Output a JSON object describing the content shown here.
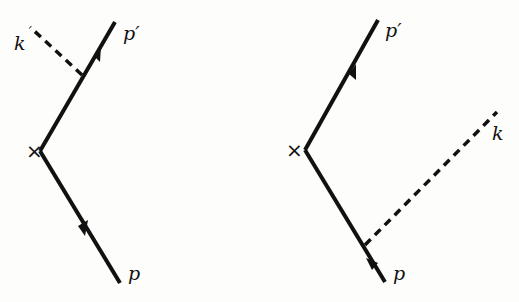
{
  "diagrams": [
    {
      "id": "left",
      "labels": {
        "incoming": "p",
        "outgoing": "p′",
        "photon": "k",
        "vertex": "×"
      },
      "photon_attached_to": "outgoing"
    },
    {
      "id": "right",
      "labels": {
        "incoming": "p",
        "outgoing": "p′",
        "photon": "k",
        "vertex": "×"
      },
      "photon_attached_to": "incoming"
    }
  ],
  "colors": {
    "line": "#111111",
    "background": "#fdfdfb"
  }
}
